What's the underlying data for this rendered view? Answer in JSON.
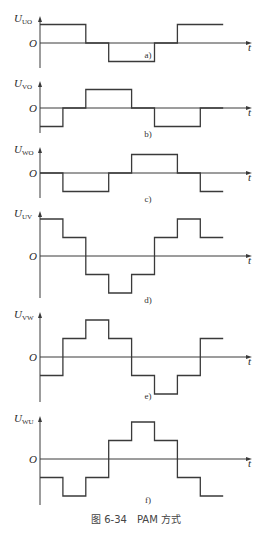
{
  "figure": {
    "caption": "图 6-34　PAM 方式",
    "t_label": "t",
    "origin_label": "O",
    "colors": {
      "line": "#3a3a3a",
      "text": "#2a2a2a",
      "background": "#ffffff"
    }
  },
  "chart_data": [
    {
      "type": "line",
      "id": "a",
      "sublabel": "a)",
      "ylabel": "U",
      "ylabel_sub": "UO",
      "x_steps": [
        0,
        60,
        120,
        180,
        240,
        300,
        360,
        420,
        480
      ],
      "levels": [
        1,
        1,
        0,
        -1,
        -1,
        0,
        1,
        1
      ]
    },
    {
      "type": "line",
      "id": "b",
      "sublabel": "b)",
      "ylabel": "U",
      "ylabel_sub": "VO",
      "x_steps": [
        0,
        60,
        120,
        180,
        240,
        300,
        360,
        420,
        480
      ],
      "levels": [
        -1,
        0,
        1,
        1,
        0,
        -1,
        -1,
        0
      ]
    },
    {
      "type": "line",
      "id": "c",
      "sublabel": "c)",
      "ylabel": "U",
      "ylabel_sub": "WO",
      "x_steps": [
        0,
        60,
        120,
        180,
        240,
        300,
        360,
        420,
        480
      ],
      "levels": [
        0,
        -1,
        -1,
        0,
        1,
        1,
        0,
        -1
      ]
    },
    {
      "type": "line",
      "id": "d",
      "sublabel": "d)",
      "ylabel": "U",
      "ylabel_sub": "UV",
      "x_steps": [
        0,
        60,
        120,
        180,
        240,
        300,
        360,
        420,
        480
      ],
      "levels": [
        2,
        1,
        -1,
        -2,
        -1,
        1,
        2,
        1
      ]
    },
    {
      "type": "line",
      "id": "e",
      "sublabel": "e)",
      "ylabel": "U",
      "ylabel_sub": "VW",
      "x_steps": [
        0,
        60,
        120,
        180,
        240,
        300,
        360,
        420,
        480
      ],
      "levels": [
        -1,
        1,
        2,
        1,
        -1,
        -2,
        -1,
        1
      ]
    },
    {
      "type": "line",
      "id": "f",
      "sublabel": "f)",
      "ylabel": "U",
      "ylabel_sub": "WU",
      "x_steps": [
        0,
        60,
        120,
        180,
        240,
        300,
        360,
        420,
        480
      ],
      "levels": [
        -1,
        -2,
        -1,
        1,
        2,
        1,
        -1,
        -2
      ]
    }
  ]
}
